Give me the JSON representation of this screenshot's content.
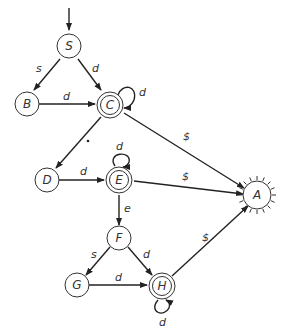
{
  "diagram": {
    "type": "finite-state-automaton",
    "start_state": "S",
    "states": [
      {
        "id": "S",
        "label": "S",
        "x": 69,
        "y": 46,
        "accepting": false
      },
      {
        "id": "B",
        "label": "B",
        "x": 27,
        "y": 104,
        "accepting": false
      },
      {
        "id": "C",
        "label": "C",
        "x": 110,
        "y": 105,
        "accepting": true
      },
      {
        "id": "D",
        "label": "D",
        "x": 47,
        "y": 180,
        "accepting": false
      },
      {
        "id": "E",
        "label": "E",
        "x": 119,
        "y": 180,
        "accepting": true
      },
      {
        "id": "F",
        "label": "F",
        "x": 119,
        "y": 238,
        "accepting": false
      },
      {
        "id": "G",
        "label": "G",
        "x": 77,
        "y": 287,
        "accepting": false
      },
      {
        "id": "H",
        "label": "H",
        "x": 162,
        "y": 287,
        "accepting": true
      },
      {
        "id": "A",
        "label": "A",
        "x": 257,
        "y": 195,
        "accepting": false,
        "style": "sunburst"
      }
    ],
    "edges": [
      {
        "from": "S",
        "to": "B",
        "label": "s"
      },
      {
        "from": "S",
        "to": "C",
        "label": "d"
      },
      {
        "from": "B",
        "to": "C",
        "label": "d"
      },
      {
        "from": "C",
        "to": "C",
        "label": "d"
      },
      {
        "from": "C",
        "to": "D",
        "label": "."
      },
      {
        "from": "C",
        "to": "A",
        "label": "$"
      },
      {
        "from": "D",
        "to": "E",
        "label": "d"
      },
      {
        "from": "E",
        "to": "E",
        "label": "d"
      },
      {
        "from": "E",
        "to": "A",
        "label": "$"
      },
      {
        "from": "E",
        "to": "F",
        "label": "e"
      },
      {
        "from": "F",
        "to": "G",
        "label": "s"
      },
      {
        "from": "F",
        "to": "H",
        "label": "d"
      },
      {
        "from": "G",
        "to": "H",
        "label": "d"
      },
      {
        "from": "H",
        "to": "H",
        "label": "d"
      },
      {
        "from": "H",
        "to": "A",
        "label": "$"
      }
    ]
  }
}
